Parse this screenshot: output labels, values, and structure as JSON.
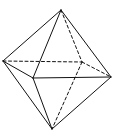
{
  "diagram": {
    "stroke_color": "#111111",
    "background": "#ffffff",
    "vertices": {
      "top": [
        61,
        10
      ],
      "left": [
        3,
        61
      ],
      "front": [
        33,
        78
      ],
      "right": [
        111,
        77
      ],
      "back": [
        82,
        62
      ],
      "bottom": [
        52,
        129
      ]
    },
    "edges": [
      {
        "from": "top",
        "to": "left",
        "style": "solid"
      },
      {
        "from": "top",
        "to": "front",
        "style": "solid"
      },
      {
        "from": "top",
        "to": "right",
        "style": "solid"
      },
      {
        "from": "left",
        "to": "front",
        "style": "solid"
      },
      {
        "from": "front",
        "to": "right",
        "style": "solid"
      },
      {
        "from": "left",
        "to": "bottom",
        "style": "solid"
      },
      {
        "from": "front",
        "to": "bottom",
        "style": "solid"
      },
      {
        "from": "right",
        "to": "bottom",
        "style": "solid"
      },
      {
        "from": "left",
        "to": "back",
        "style": "dashed"
      },
      {
        "from": "back",
        "to": "right",
        "style": "dashed"
      },
      {
        "from": "top",
        "to": "back",
        "style": "dashed"
      },
      {
        "from": "back",
        "to": "bottom",
        "style": "dashed"
      }
    ]
  }
}
